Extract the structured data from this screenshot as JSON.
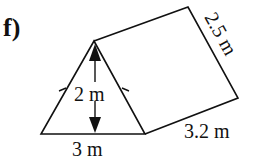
{
  "problem": {
    "part_label": "f)",
    "shape": "triangular prism",
    "dimensions": {
      "triangle_height": "2 m",
      "triangle_base": "3 m",
      "prism_length": "3.2 m",
      "slant_side": "2.5 m"
    }
  },
  "colors": {
    "stroke": "#111111",
    "background": "#ffffff"
  }
}
